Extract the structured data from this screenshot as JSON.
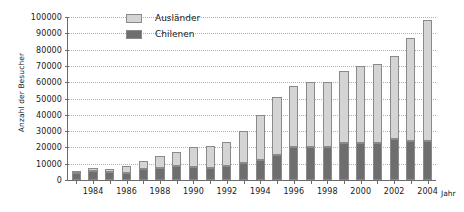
{
  "chart_data": {
    "type": "bar",
    "subtype": "stacked-bar",
    "title": "",
    "xlabel": "Jahr",
    "ylabel": "Anzahl der Besucher",
    "ylim": [
      0,
      100000
    ],
    "ytick_step": 10000,
    "grid": true,
    "legend_position": "top-center",
    "categories": [
      "1983",
      "1984",
      "1985",
      "1986",
      "1987",
      "1988",
      "1989",
      "1990",
      "1991",
      "1992",
      "1993",
      "1994",
      "1995",
      "1996",
      "1997",
      "1998",
      "1999",
      "2000",
      "2001",
      "2002",
      "2003",
      "2004"
    ],
    "xtick_labels": [
      "1984",
      "1986",
      "1988",
      "1990",
      "1992",
      "1994",
      "1996",
      "1998",
      "2000",
      "2002",
      "2004"
    ],
    "ytick_labels": [
      "0",
      "10000",
      "20000",
      "30000",
      "40000",
      "50000",
      "60000",
      "70000",
      "80000",
      "90000",
      "100000"
    ],
    "series": [
      {
        "name": "Chilenen",
        "color": "#6e6e6e",
        "values": [
          4200,
          5800,
          4800,
          4300,
          6500,
          7300,
          8300,
          8200,
          7200,
          8300,
          10500,
          12500,
          15500,
          20500,
          20500,
          20200,
          22500,
          23000,
          23000,
          25000,
          24000,
          24000
        ]
      },
      {
        "name": "Ausländer",
        "color": "#d4d4d4",
        "values": [
          1600,
          1800,
          1900,
          4100,
          5400,
          7500,
          9100,
          12000,
          13700,
          15000,
          19500,
          27500,
          35500,
          37000,
          39500,
          40000,
          44500,
          47000,
          48000,
          51000,
          63000,
          74000
        ]
      }
    ],
    "totals": [
      5800,
      7600,
      6700,
      8400,
      11900,
      14800,
      17400,
      20200,
      20900,
      23300,
      30000,
      40000,
      51000,
      57500,
      60000,
      60200,
      67000,
      70000,
      71000,
      76000,
      87000,
      98000
    ]
  },
  "legend": {
    "items": [
      {
        "label": "Ausländer",
        "swatch_color": "#d4d4d4"
      },
      {
        "label": "Chilenen",
        "swatch_color": "#6e6e6e"
      }
    ]
  },
  "axes": {
    "y_title": "Anzahl der Besucher",
    "x_title": "Jahr"
  },
  "colors": {
    "axis": "#6b6b6b",
    "grid": "#b0b0b0",
    "bar_border": "#8a8a8a",
    "text": "#1a1a1a",
    "background": "#ffffff"
  }
}
